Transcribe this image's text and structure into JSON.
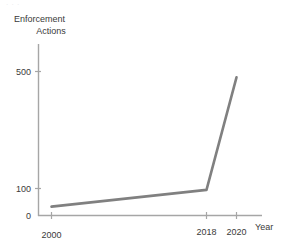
{
  "page": {
    "background_color": "#ffffff",
    "top_text_sliver": "· · ·"
  },
  "chart_data": {
    "type": "line",
    "title": "",
    "subtitle": "",
    "xlabel": "Year",
    "ylabel": "Enforcement Actions",
    "ylabel_lines": [
      "Enforcement",
      "Actions"
    ],
    "x": [
      2000,
      2018,
      2020
    ],
    "values": [
      33,
      95,
      480
    ],
    "series": [
      {
        "name": "Enforcement Actions",
        "x": [
          2000,
          2018,
          2020
        ],
        "values": [
          33,
          95,
          480
        ],
        "color": "#808080"
      }
    ],
    "xtick_labels": [
      "2000",
      "2018",
      "2020"
    ],
    "xtick_values": [
      2000,
      2018,
      2020
    ],
    "ytick_labels": [
      "0",
      "100",
      "500"
    ],
    "ytick_values": [
      0,
      100,
      500
    ],
    "xlim": [
      1998,
      2023
    ],
    "ylim": [
      0,
      560
    ],
    "grid": false,
    "legend": "none",
    "line_color": "#808080",
    "axis_color": "#a6a6a6",
    "line_width": 2.6,
    "markers": false
  },
  "axis": {
    "x_tick_0_label": "2000",
    "x_tick_1_label": "2018",
    "x_tick_2_label": "2020",
    "y_tick_0_label": "0",
    "y_tick_1_label": "100",
    "y_tick_2_label": "500"
  }
}
